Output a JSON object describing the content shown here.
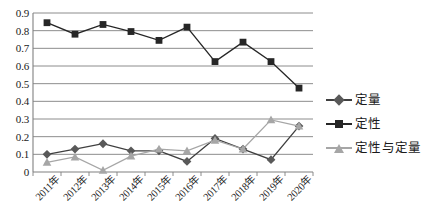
{
  "chart_data": {
    "type": "line",
    "title": "",
    "xlabel": "",
    "ylabel": "",
    "categories": [
      "2011年",
      "2012年",
      "2013年",
      "2014年",
      "2015年",
      "2016年",
      "2017年",
      "2018年",
      "2019年",
      "2020年"
    ],
    "ylim": [
      0,
      0.9
    ],
    "ytick_labels": [
      "0.9",
      "0.8",
      "0.7",
      "0.6",
      "0.5",
      "0.4",
      "0.3",
      "0.2",
      "0.1",
      "0"
    ],
    "ytick_values": [
      0.9,
      0.8,
      0.7,
      0.6,
      0.5,
      0.4,
      0.3,
      0.2,
      0.1,
      0
    ],
    "grid": "horizontal",
    "legend_position": "right",
    "series": [
      {
        "name": "定量",
        "marker": "diamond",
        "color": "#595959",
        "line_color": "#3f3f3f",
        "values": [
          0.1,
          0.13,
          0.16,
          0.12,
          0.12,
          0.06,
          0.19,
          0.13,
          0.07,
          0.26
        ]
      },
      {
        "name": "定性",
        "marker": "square",
        "color": "#262626",
        "line_color": "#262626",
        "values": [
          0.845,
          0.78,
          0.835,
          0.795,
          0.745,
          0.82,
          0.625,
          0.735,
          0.625,
          0.475
        ]
      },
      {
        "name": "定性与定量",
        "marker": "triangle",
        "color": "#a6a6a6",
        "line_color": "#a6a6a6",
        "values": [
          0.055,
          0.085,
          0.01,
          0.09,
          0.13,
          0.12,
          0.18,
          0.13,
          0.295,
          0.26
        ]
      }
    ]
  },
  "style": {
    "grid_color": "#808080",
    "axis_color": "#808080",
    "background": "#ffffff"
  }
}
